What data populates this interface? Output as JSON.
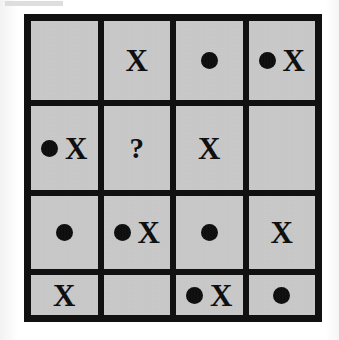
{
  "puzzle": {
    "title": "Dot and X grid puzzle",
    "rows": 4,
    "columns": 4,
    "symbols": {
      "dot": "●",
      "x": "X",
      "question": "?"
    },
    "colors": {
      "cell_fill": "#c9c9c9",
      "grid_line": "#111111",
      "symbol": "#0c0c0c",
      "page_background": "#fdfdfd"
    },
    "cells": [
      [
        {
          "id": "r1c1",
          "contents": [],
          "label": ""
        },
        {
          "id": "r1c2",
          "contents": [
            "x"
          ],
          "label": "X"
        },
        {
          "id": "r1c3",
          "contents": [
            "dot"
          ],
          "label": "●"
        },
        {
          "id": "r1c4",
          "contents": [
            "dot",
            "x"
          ],
          "label": "● X"
        }
      ],
      [
        {
          "id": "r2c1",
          "contents": [
            "dot",
            "x"
          ],
          "label": "● X"
        },
        {
          "id": "r2c2",
          "contents": [
            "question"
          ],
          "label": "?"
        },
        {
          "id": "r2c3",
          "contents": [
            "x"
          ],
          "label": "X"
        },
        {
          "id": "r2c4",
          "contents": [],
          "label": ""
        }
      ],
      [
        {
          "id": "r3c1",
          "contents": [
            "dot"
          ],
          "label": "●"
        },
        {
          "id": "r3c2",
          "contents": [
            "dot",
            "x"
          ],
          "label": "● X"
        },
        {
          "id": "r3c3",
          "contents": [
            "dot"
          ],
          "label": "●"
        },
        {
          "id": "r3c4",
          "contents": [
            "x"
          ],
          "label": "X"
        }
      ],
      [
        {
          "id": "r4c1",
          "contents": [
            "x"
          ],
          "label": "X"
        },
        {
          "id": "r4c2",
          "contents": [],
          "label": ""
        },
        {
          "id": "r4c3",
          "contents": [
            "dot",
            "x"
          ],
          "label": "● X"
        },
        {
          "id": "r4c4",
          "contents": [
            "dot"
          ],
          "label": "●"
        }
      ]
    ]
  }
}
